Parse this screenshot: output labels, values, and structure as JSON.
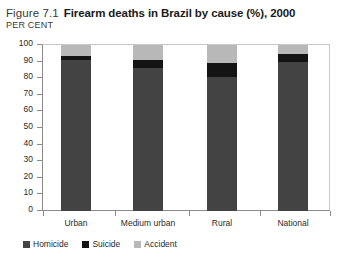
{
  "figure": {
    "number": "Figure 7.1",
    "title": "Firearm deaths in Brazil by cause (%), 2000",
    "unit_label": "PER CENT"
  },
  "chart_data": {
    "type": "bar",
    "subtype": "stacked-column",
    "title": "Firearm deaths in Brazil by cause (%), 2000",
    "xlabel": "",
    "ylabel": "PER CENT",
    "ylim": [
      0,
      100
    ],
    "yticks": [
      0,
      10,
      20,
      30,
      40,
      50,
      60,
      70,
      80,
      90,
      100
    ],
    "grid": false,
    "legend_position": "bottom-left",
    "categories": [
      "Urban",
      "Medium urban",
      "Rural",
      "National"
    ],
    "series": [
      {
        "name": "Homicide",
        "color": "#434343",
        "values": [
          91,
          86,
          81,
          89.5
        ]
      },
      {
        "name": "Suicide",
        "color": "#141414",
        "values": [
          2.5,
          5,
          8,
          5
        ]
      },
      {
        "name": "Accident",
        "color": "#b8b8b8",
        "values": [
          6.5,
          9,
          11,
          5.5
        ]
      }
    ]
  },
  "colors": {
    "homicide": "#434343",
    "suicide": "#141414",
    "accident": "#b8b8b8",
    "axis": "#8b8b8b",
    "text": "#2a2a2a"
  }
}
